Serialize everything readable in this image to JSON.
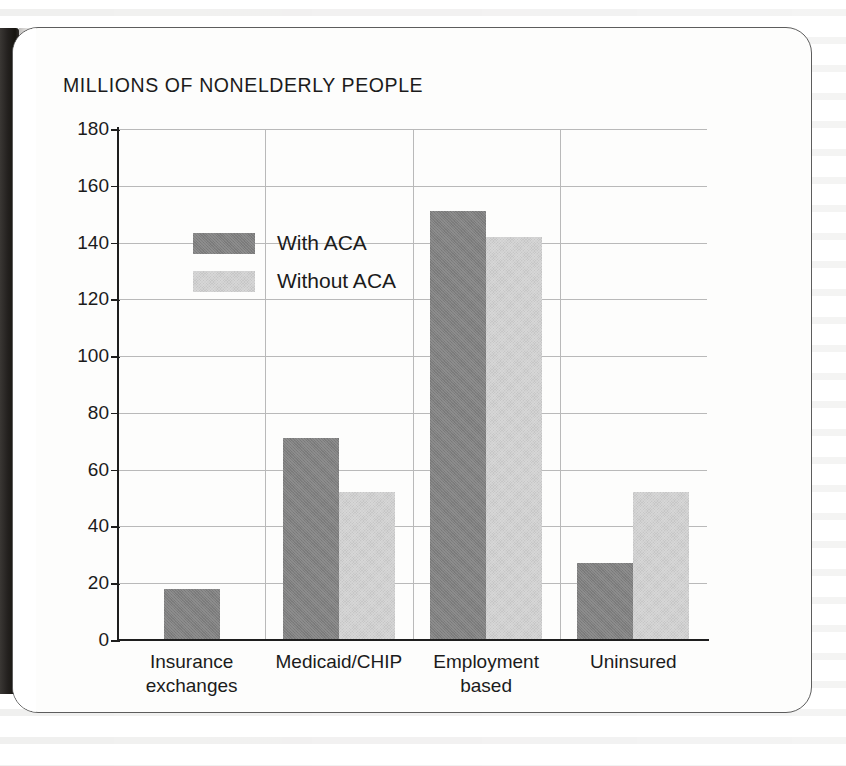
{
  "chart_data": {
    "type": "bar",
    "title": "MILLIONS OF NONELDERLY PEOPLE",
    "xlabel": "",
    "ylabel": "",
    "ylim": [
      0,
      180
    ],
    "yticks": [
      0,
      20,
      40,
      60,
      80,
      100,
      120,
      140,
      160,
      180
    ],
    "ytick_labels": [
      "0",
      "20",
      "40",
      "60",
      "80",
      "100",
      "120",
      "140",
      "160",
      "180"
    ],
    "grid": true,
    "legend_position": "upper-left-inside",
    "categories": [
      "Insurance\nexchanges",
      "Medicaid/CHIP",
      "Employment\nbased",
      "Uninsured"
    ],
    "series": [
      {
        "name": "With ACA",
        "color": "#808080",
        "values": [
          18,
          71,
          151,
          27
        ]
      },
      {
        "name": "Without ACA",
        "color": "#d2d2d2",
        "values": [
          0,
          52,
          142,
          52
        ]
      }
    ]
  },
  "legend": {
    "entries": [
      {
        "label": "With ACA",
        "swatch": "#808080"
      },
      {
        "label": "Without ACA",
        "swatch": "#d2d2d2"
      }
    ]
  },
  "colors": {
    "with_aca": "#808080",
    "without_aca": "#d2d2d2",
    "axis": "#1e1e1e",
    "grid": "#b9b9b9",
    "text": "#1b1b1b",
    "card_border": "#5d5d5d",
    "page_background": "#ffffff",
    "book_gutter": "#16140f"
  }
}
